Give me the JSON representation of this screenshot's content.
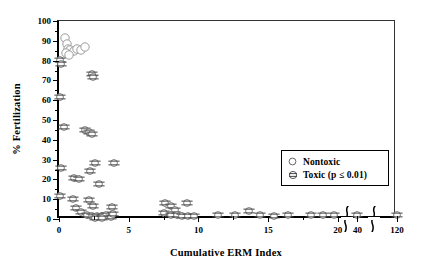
{
  "chart_data": {
    "type": "scatter",
    "title": "",
    "xlabel": "Cumulative ERM Index",
    "ylabel": "% Fertilization",
    "xlim": [
      0,
      120
    ],
    "ylim": [
      0,
      100
    ],
    "grid": false,
    "y_ticks": [
      0,
      10,
      20,
      30,
      40,
      50,
      60,
      70,
      80,
      90,
      100
    ],
    "y_tick_labels": [
      "0",
      "10",
      "20",
      "30",
      "40",
      "50",
      "60",
      "70",
      "80",
      "90",
      "100"
    ],
    "y_minor_step": 5,
    "x_ticks": [
      0,
      5,
      10,
      15,
      20,
      40,
      120
    ],
    "x_tick_labels": [
      "0",
      "5",
      "10",
      "15",
      "20",
      "40",
      "120"
    ],
    "x_minor_step": 2.5,
    "axis_breaks": [
      {
        "label": "break-after-20",
        "after": 20
      },
      {
        "label": "break-after-40",
        "after": 40
      }
    ],
    "legend": {
      "position": "center-right",
      "entries": [
        {
          "label": "Nontoxic",
          "symbol": "open-circle"
        },
        {
          "label": "Toxic (p ≤ 0.01)",
          "symbol": "barred-circle"
        }
      ]
    },
    "series": [
      {
        "name": "Nontoxic",
        "symbol": "open-circle",
        "points": [
          [
            0.45,
            91.5
          ],
          [
            0.55,
            88.5
          ],
          [
            0.62,
            86.0
          ],
          [
            0.8,
            85.5
          ],
          [
            1.05,
            85.0
          ],
          [
            1.3,
            86.0
          ],
          [
            1.55,
            85.5
          ],
          [
            1.85,
            87.0
          ],
          [
            0.5,
            84.0
          ],
          [
            0.72,
            83.0
          ]
        ]
      },
      {
        "name": "Toxic (p ≤ 0.01)",
        "symbol": "barred-circle",
        "points": [
          [
            0.1,
            80.5
          ],
          [
            0.12,
            78.5
          ],
          [
            2.35,
            73.0
          ],
          [
            2.42,
            71.5
          ],
          [
            0.1,
            61.5
          ],
          [
            0.35,
            46.5
          ],
          [
            1.9,
            45.0
          ],
          [
            2.15,
            44.0
          ],
          [
            2.35,
            43.0
          ],
          [
            0.12,
            26.0
          ],
          [
            2.6,
            28.5
          ],
          [
            3.95,
            28.5
          ],
          [
            2.2,
            24.0
          ],
          [
            1.05,
            20.5
          ],
          [
            1.4,
            20.0
          ],
          [
            2.85,
            17.5
          ],
          [
            0.1,
            11.5
          ],
          [
            1.0,
            10.0
          ],
          [
            2.15,
            9.5
          ],
          [
            7.6,
            8.0
          ],
          [
            1.25,
            5.5
          ],
          [
            2.45,
            6.5
          ],
          [
            3.8,
            6.0
          ],
          [
            8.05,
            6.5
          ],
          [
            8.3,
            4.5
          ],
          [
            9.2,
            8.0
          ],
          [
            1.55,
            3.5
          ],
          [
            2.0,
            1.8
          ],
          [
            2.35,
            1.5
          ],
          [
            2.7,
            1.6
          ],
          [
            3.05,
            1.4
          ],
          [
            3.4,
            1.8
          ],
          [
            3.75,
            1.2
          ],
          [
            2.55,
            0.6
          ],
          [
            3.1,
            0.5
          ],
          [
            3.9,
            2.5
          ],
          [
            7.55,
            3.2
          ],
          [
            8.05,
            2.0
          ],
          [
            8.45,
            1.8
          ],
          [
            8.85,
            1.6
          ],
          [
            9.25,
            1.5
          ],
          [
            9.7,
            1.7
          ],
          [
            11.4,
            1.8
          ],
          [
            12.6,
            1.8
          ],
          [
            13.6,
            4.0
          ],
          [
            14.4,
            1.8
          ],
          [
            15.4,
            1.5
          ],
          [
            16.45,
            1.8
          ],
          [
            18.1,
            1.8
          ],
          [
            18.9,
            2.2
          ],
          [
            19.7,
            1.8
          ],
          [
            40.0,
            1.8
          ],
          [
            120.0,
            1.8
          ]
        ]
      }
    ]
  }
}
